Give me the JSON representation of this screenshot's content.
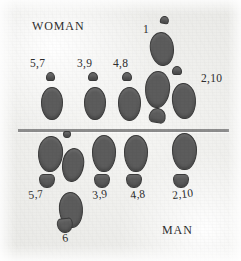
{
  "figure": {
    "name": "footprint-gait-diagram",
    "background_color": "#eeeeeb",
    "divider_color": "#8d8d8d",
    "mark_fill_color": "#5c5c5c",
    "mark_outline_color": "#3a3a3a",
    "text_color": "#2e2e2e"
  },
  "side_labels": {
    "top": "WOMAN",
    "bottom": "MAN"
  },
  "number_labels": {
    "woman": [
      {
        "text": "5,7",
        "x": 30,
        "y": 58
      },
      {
        "text": "3,9",
        "x": 77,
        "y": 58
      },
      {
        "text": "4,8",
        "x": 113,
        "y": 58
      },
      {
        "text": "1",
        "x": 143,
        "y": 24
      },
      {
        "text": "2,10",
        "x": 201,
        "y": 73
      }
    ],
    "man": [
      {
        "text": "5,7",
        "x": 29,
        "y": 190
      },
      {
        "text": "3,9",
        "x": 93,
        "y": 190
      },
      {
        "text": "4,8",
        "x": 131,
        "y": 190
      },
      {
        "text": "2,10",
        "x": 173,
        "y": 190
      },
      {
        "text": "6",
        "x": 63,
        "y": 233
      }
    ]
  },
  "divider": {
    "x": 18,
    "y": 129,
    "width": 211,
    "height": 3
  },
  "chart_data": {
    "type": "scatter",
    "xlabel": "",
    "ylabel": "",
    "legend": [
      "WOMAN",
      "MAN"
    ],
    "series": [
      {
        "name": "WOMAN",
        "step_labels": [
          "5,7",
          "3,9",
          "4,8",
          "1",
          "2,10"
        ],
        "marks": [
          {
            "shape": "toe",
            "x": 46,
            "y": 72,
            "w": 9,
            "h": 9,
            "rot": 0,
            "step": "5,7"
          },
          {
            "shape": "sole",
            "x": 41,
            "y": 87,
            "w": 22,
            "h": 33,
            "rot": 0,
            "step": "5,7"
          },
          {
            "shape": "toe",
            "x": 88,
            "y": 72,
            "w": 10,
            "h": 9,
            "rot": 0,
            "step": "3,9"
          },
          {
            "shape": "sole",
            "x": 84,
            "y": 87,
            "w": 22,
            "h": 33,
            "rot": 0,
            "step": "3,9"
          },
          {
            "shape": "toe",
            "x": 122,
            "y": 72,
            "w": 10,
            "h": 9,
            "rot": 0,
            "step": "4,8"
          },
          {
            "shape": "sole",
            "x": 118,
            "y": 87,
            "w": 23,
            "h": 34,
            "rot": 0,
            "step": "4,8"
          },
          {
            "shape": "toe",
            "x": 160,
            "y": 16,
            "w": 9,
            "h": 8,
            "rot": 10,
            "step": "1"
          },
          {
            "shape": "sole",
            "x": 150,
            "y": 32,
            "w": 24,
            "h": 34,
            "rot": -8,
            "step": "1"
          },
          {
            "shape": "sole",
            "x": 145,
            "y": 71,
            "w": 25,
            "h": 37,
            "rot": 4,
            "step": "1"
          },
          {
            "shape": "toe",
            "x": 149,
            "y": 108,
            "w": 17,
            "h": 15,
            "rot": 10,
            "step": "1"
          },
          {
            "shape": "toe",
            "x": 172,
            "y": 66,
            "w": 10,
            "h": 9,
            "rot": 0,
            "step": "2,10"
          },
          {
            "shape": "sole",
            "x": 172,
            "y": 83,
            "w": 24,
            "h": 36,
            "rot": -4,
            "step": "2,10"
          }
        ]
      },
      {
        "name": "MAN",
        "step_labels": [
          "5,7",
          "3,9",
          "4,8",
          "2,10",
          "6"
        ],
        "marks": [
          {
            "shape": "sole",
            "x": 38,
            "y": 136,
            "w": 25,
            "h": 36,
            "rot": 4,
            "step": "5,7"
          },
          {
            "shape": "toe",
            "x": 39,
            "y": 174,
            "w": 16,
            "h": 14,
            "rot": 0,
            "step": "5,7"
          },
          {
            "shape": "sole",
            "x": 62,
            "y": 148,
            "w": 22,
            "h": 34,
            "rot": 8,
            "step": "6"
          },
          {
            "shape": "sole",
            "x": 59,
            "y": 192,
            "w": 24,
            "h": 36,
            "rot": -4,
            "step": "6"
          },
          {
            "shape": "toe",
            "x": 57,
            "y": 218,
            "w": 16,
            "h": 15,
            "rot": -6,
            "step": "6"
          },
          {
            "shape": "toe",
            "x": 63,
            "y": 131,
            "w": 8,
            "h": 7,
            "rot": 0,
            "step": "6"
          },
          {
            "shape": "sole",
            "x": 92,
            "y": 135,
            "w": 24,
            "h": 37,
            "rot": 0,
            "step": "3,9"
          },
          {
            "shape": "toe",
            "x": 94,
            "y": 174,
            "w": 16,
            "h": 14,
            "rot": 0,
            "step": "3,9"
          },
          {
            "shape": "sole",
            "x": 124,
            "y": 135,
            "w": 24,
            "h": 37,
            "rot": 0,
            "step": "4,8"
          },
          {
            "shape": "toe",
            "x": 126,
            "y": 174,
            "w": 16,
            "h": 14,
            "rot": 0,
            "step": "4,8"
          },
          {
            "shape": "sole",
            "x": 172,
            "y": 133,
            "w": 25,
            "h": 37,
            "rot": 0,
            "step": "2,10"
          },
          {
            "shape": "toe",
            "x": 173,
            "y": 174,
            "w": 16,
            "h": 14,
            "rot": 0,
            "step": "2,10"
          }
        ]
      }
    ]
  }
}
